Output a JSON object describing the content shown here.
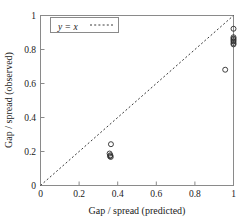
{
  "chart_data": {
    "type": "scatter",
    "title": "",
    "xlabel": "Gap / spread (predicted)",
    "ylabel": "Gap / spread (observed)",
    "xlim": [
      0,
      1
    ],
    "ylim": [
      0,
      1
    ],
    "grid": false,
    "xticks": [
      0,
      0.2,
      0.4,
      0.6,
      0.8,
      1
    ],
    "yticks": [
      0,
      0.2,
      0.4,
      0.6,
      0.8,
      1
    ],
    "xtick_labels": [
      "0",
      "0.2",
      "0.4",
      "0.6",
      "0.8",
      "1"
    ],
    "ytick_labels": [
      "0",
      "0.2",
      "0.4",
      "0.6",
      "0.8",
      "1"
    ],
    "legend": {
      "position": "top-left-inside",
      "entries": [
        {
          "label": "y = x",
          "style": "dashed-line",
          "color": "#3a3a3a"
        }
      ]
    },
    "annotations": [],
    "series": [
      {
        "name": "y = x",
        "type": "line",
        "style": "dashed",
        "color": "#3a3a3a",
        "x": [
          0,
          1
        ],
        "y": [
          0,
          1
        ]
      },
      {
        "name": "observed vs predicted",
        "type": "scatter",
        "marker": "open-circle",
        "color": "#2b2b2b",
        "points": [
          {
            "x": 0.365,
            "y": 0.243
          },
          {
            "x": 0.358,
            "y": 0.188
          },
          {
            "x": 0.362,
            "y": 0.178
          },
          {
            "x": 0.36,
            "y": 0.172
          },
          {
            "x": 0.364,
            "y": 0.168
          },
          {
            "x": 0.957,
            "y": 0.681
          },
          {
            "x": 1.0,
            "y": 0.922
          },
          {
            "x": 1.0,
            "y": 0.872
          },
          {
            "x": 1.0,
            "y": 0.864
          },
          {
            "x": 1.0,
            "y": 0.856
          },
          {
            "x": 1.0,
            "y": 0.848
          },
          {
            "x": 1.0,
            "y": 0.838
          },
          {
            "x": 1.0,
            "y": 0.83
          }
        ]
      }
    ]
  }
}
